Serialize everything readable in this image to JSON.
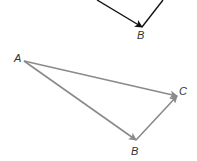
{
  "diagram": {
    "top_figure": {
      "color": "#111111",
      "vertex_label": "B",
      "segments": [
        {
          "from": [
            97,
            0
          ],
          "to": [
            142,
            27
          ],
          "arrow": true
        },
        {
          "from": [
            142,
            27
          ],
          "to": [
            163,
            0
          ],
          "arrow": false
        }
      ],
      "label_pos": [
        137,
        38
      ]
    },
    "bottom_figure": {
      "color": "#8a8a8a",
      "labels": {
        "A": "A",
        "B": "B",
        "C": "C"
      },
      "points": {
        "A": [
          24,
          61
        ],
        "B": [
          136,
          140
        ],
        "C": [
          177,
          96
        ]
      },
      "vectors": [
        {
          "name": "AB",
          "from": "A",
          "to": "B"
        },
        {
          "name": "BC",
          "from": "B",
          "to": "C"
        },
        {
          "name": "AC",
          "from": "A",
          "to": "C"
        }
      ]
    }
  }
}
